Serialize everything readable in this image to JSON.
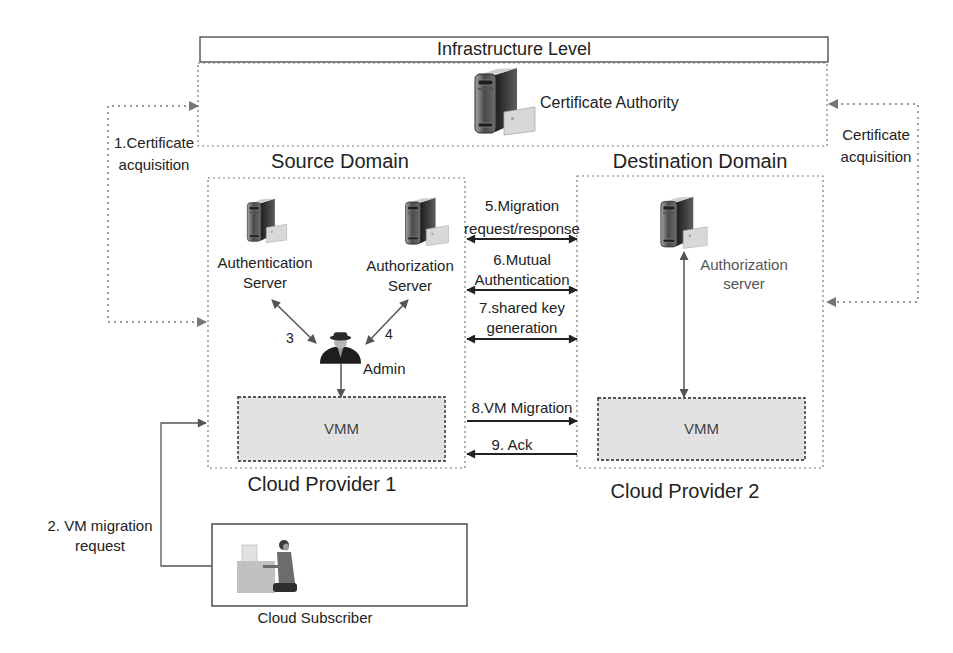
{
  "infrastructure": {
    "title": "Infrastructure Level",
    "certificate_authority": {
      "label": "Certificate Authority",
      "icon": "server-certificate-icon"
    }
  },
  "certificate_acquisition": {
    "left": {
      "line1": "1.Certificate",
      "line2": "acquisition"
    },
    "right": {
      "line1": "Certificate",
      "line2": "acquisition"
    }
  },
  "source_domain": {
    "title": "Source Domain",
    "provider": "Cloud Provider 1",
    "authentication_server": {
      "line1": "Authentication",
      "line2": "Server",
      "icon": "server-icon"
    },
    "authorization_server": {
      "line1": "Authorization",
      "line2": "Server",
      "icon": "server-certificate-icon"
    },
    "admin": {
      "label": "Admin",
      "icon": "admin-user-icon"
    },
    "step_labels": {
      "authentication": "3",
      "authorization": "4"
    },
    "vmm": "VMM"
  },
  "destination_domain": {
    "title": "Destination Domain",
    "provider": "Cloud Provider 2",
    "authorization_server": {
      "line1": "Authorization",
      "line2": "server",
      "icon": "server-certificate-icon"
    },
    "vmm": "VMM"
  },
  "messages": [
    {
      "line1": "5.Migration",
      "line2": "request/response",
      "direction": "both"
    },
    {
      "line1": "6.Mutual",
      "line2": "Authentication",
      "direction": "both"
    },
    {
      "line1": "7.shared key",
      "line2": "generation",
      "direction": "both"
    },
    {
      "line1": "8.VM Migration",
      "direction": "right"
    },
    {
      "line1": "9. Ack",
      "direction": "left"
    }
  ],
  "subscriber": {
    "label": "Cloud Subscriber",
    "icon": "person-at-desk-icon",
    "request": {
      "line1": "2. VM migration",
      "line2": "request"
    }
  },
  "colors": {
    "background": "#ffffff",
    "text": "#222222",
    "dotted_border": "#777777",
    "vmm_fill": "#e2e2e2",
    "arrow": "#333333"
  }
}
